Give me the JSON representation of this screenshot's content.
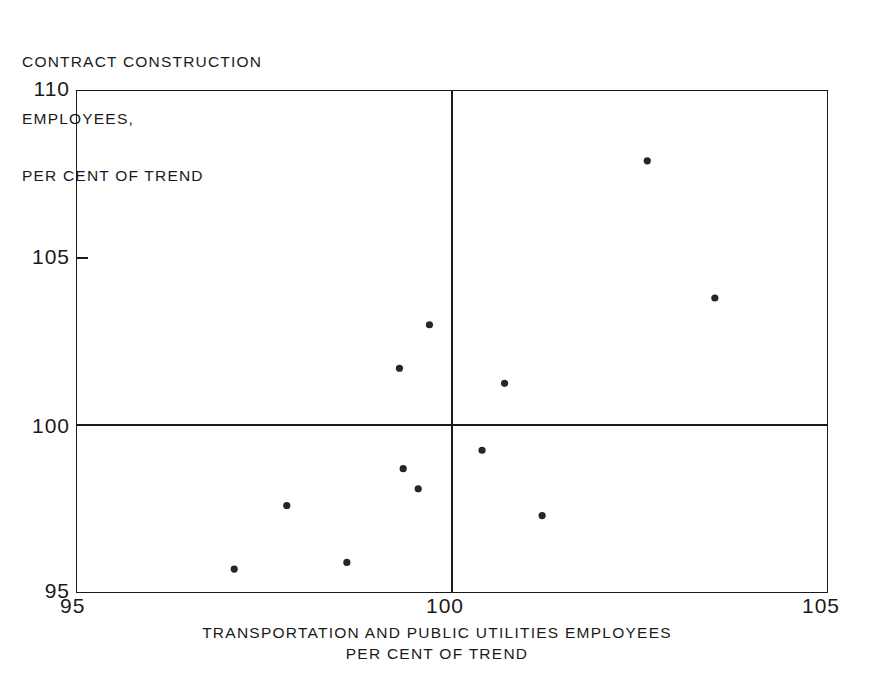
{
  "figure": {
    "title_lines": [
      "CONTRACT CONSTRUCTION",
      "EMPLOYEES,",
      "PER CENT OF TREND"
    ],
    "y_axis_caption_line1": "CONTRACT CONSTRUCTION",
    "y_axis_caption_line2": "EMPLOYEES,",
    "y_axis_caption_line3": "PER CENT OF TREND",
    "x_axis_caption_line1": "TRANSPORTATION AND PUBLIC UTILITIES EMPLOYEES",
    "x_axis_caption_line2": "PER CENT OF TREND",
    "y_tick_top": "110",
    "y_tick_mid": "105",
    "y_tick_low": "100",
    "y_tick_bottom": "95",
    "x_tick_left": "95",
    "x_tick_mid": "100",
    "x_tick_right": "105",
    "line_color": "#1a1a1a",
    "point_color": "#262626",
    "background_color": "#ffffff"
  },
  "chart_data": {
    "type": "scatter",
    "xlabel": "TRANSPORTATION AND PUBLIC UTILITIES EMPLOYEES PER CENT OF TREND",
    "ylabel": "CONTRACT CONSTRUCTION EMPLOYEES, PER CENT OF TREND",
    "xlim": [
      95,
      105
    ],
    "ylim": [
      95,
      110
    ],
    "xticks": [
      95,
      100,
      105
    ],
    "yticks": [
      95,
      100,
      105,
      110
    ],
    "grid": false,
    "legend": "none",
    "reference_lines": {
      "vertical_x": 100,
      "horizontal_y": 100
    },
    "points": [
      {
        "x": 102.6,
        "y": 107.9
      },
      {
        "x": 103.5,
        "y": 103.8
      },
      {
        "x": 99.7,
        "y": 103.0
      },
      {
        "x": 99.3,
        "y": 101.7
      },
      {
        "x": 100.7,
        "y": 101.25
      },
      {
        "x": 100.4,
        "y": 99.25
      },
      {
        "x": 99.35,
        "y": 98.7
      },
      {
        "x": 99.55,
        "y": 98.1
      },
      {
        "x": 97.8,
        "y": 97.6
      },
      {
        "x": 101.2,
        "y": 97.3
      },
      {
        "x": 98.6,
        "y": 95.9
      },
      {
        "x": 97.1,
        "y": 95.7
      }
    ]
  }
}
